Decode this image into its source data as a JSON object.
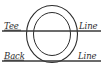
{
  "diagram": {
    "background_color": "#ffffff",
    "stroke_color": "#2b2b2b",
    "labels": {
      "tee_word": "Tee",
      "tee_line_word": "Line",
      "back_word": "Back",
      "back_line_word": "Line"
    },
    "rings": [
      {
        "name": "outer-circle",
        "cx": 52,
        "cy": 34,
        "rx": 25.5,
        "ry": 28.5
      },
      {
        "name": "inner-circle",
        "cx": 52,
        "cy": 34,
        "rx": 18.5,
        "ry": 21.5
      }
    ],
    "lines": [
      {
        "name": "tee-line",
        "y": 31,
        "x1": 2,
        "x2": 101
      },
      {
        "name": "back-line",
        "y": 61,
        "x1": 2,
        "x2": 101
      }
    ]
  }
}
